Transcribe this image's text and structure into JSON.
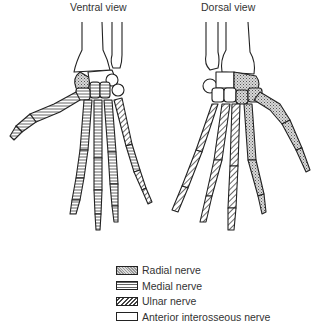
{
  "diagram": {
    "views": [
      {
        "id": "ventral",
        "title": "Ventral view"
      },
      {
        "id": "dorsal",
        "title": "Dorsal view"
      }
    ],
    "legend": [
      {
        "label": "Radial nerve",
        "pattern": "crosshatch-stipple"
      },
      {
        "label": "Medial nerve",
        "pattern": "horizontal-lines"
      },
      {
        "label": "Ulnar nerve",
        "pattern": "diagonal-lines"
      },
      {
        "label": "Anterior interosseous nerve",
        "pattern": "blank"
      }
    ],
    "colors": {
      "outline": "#222222",
      "background": "#ffffff",
      "fill": "#ffffff"
    }
  }
}
